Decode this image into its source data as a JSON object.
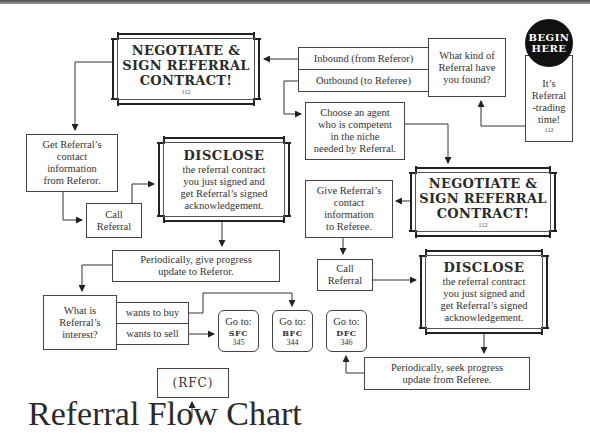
{
  "title": "Referral Flow Chart",
  "start": {
    "badge_line1": "BEGIN",
    "badge_line2": "HERE",
    "text_lines": [
      "It’s",
      "Referral",
      "-trading",
      "time!"
    ],
    "page": "112"
  },
  "question_kind": {
    "lines": [
      "What kind of",
      "Referral have",
      "you found?"
    ]
  },
  "options_kind": {
    "inbound": "Inbound (from Referor)",
    "outbound": "Outbound (to Referee)"
  },
  "negotiate_inbound": {
    "lines": [
      "NEGOTIATE &",
      "SIGN REFERRAL",
      "CONTRACT!"
    ],
    "page": "112"
  },
  "negotiate_outbound": {
    "lines": [
      "NEGOTIATE &",
      "SIGN REFERRAL",
      "CONTRACT!"
    ],
    "page": "112"
  },
  "choose_agent": {
    "lines": [
      "Choose an agent",
      "who is competent",
      "in the niche",
      "needed by Referral."
    ]
  },
  "get_contact": {
    "lines": [
      "Get Referral’s",
      "contact",
      "information",
      "from Referor."
    ]
  },
  "give_contact": {
    "lines": [
      "Give Referral’s",
      "contact",
      "information",
      "to Referee."
    ]
  },
  "call_referral_inbound": {
    "lines": [
      "Call",
      "Referral"
    ]
  },
  "call_referral_outbound": {
    "lines": [
      "Call",
      "Referral"
    ]
  },
  "disclose_inbound": {
    "title": "DISCLOSE",
    "lines": [
      "the referral contract",
      "you just signed and",
      "get Referral’s signed",
      "acknowledgement."
    ]
  },
  "disclose_outbound": {
    "title": "DISCLOSE",
    "lines": [
      "the referral contract",
      "you just signed and",
      "get Referral’s signed",
      "acknowledgement."
    ]
  },
  "progress_inbound": {
    "lines": [
      "Periodically, give progress",
      "update to Referor."
    ]
  },
  "progress_outbound": {
    "lines": [
      "Periodically, seek progress",
      "update from Referee."
    ]
  },
  "question_interest": {
    "lines": [
      "What is",
      "Referral’s",
      "interest?"
    ]
  },
  "options_interest": {
    "buy": "wants to buy",
    "sell": "wants to sell"
  },
  "goto": [
    {
      "label": "Go to:",
      "code": "SFC",
      "page": "345"
    },
    {
      "label": "Go to:",
      "code": "BFC",
      "page": "344"
    },
    {
      "label": "Go to:",
      "code": "DFC",
      "page": "346"
    }
  ],
  "rfc_label": "(RFC)",
  "colors": {
    "line": "#333333",
    "badge_bg": "#111111",
    "badge_text": "#ffffff",
    "background": "#ffffff"
  }
}
